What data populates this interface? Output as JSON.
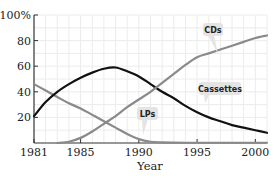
{
  "chart_data": {
    "type": "line",
    "title": "",
    "xlabel": "Year",
    "ylabel": "",
    "xlim": [
      1981,
      2001
    ],
    "ylim": [
      0,
      100
    ],
    "grid": true,
    "legend": "inline-callouts",
    "x_ticks": [
      1981,
      1985,
      1990,
      1995,
      2000
    ],
    "x_tick_labels": [
      "1981",
      "1985",
      "1990",
      "1995",
      "2000"
    ],
    "y_ticks": [
      20,
      40,
      60,
      80,
      100
    ],
    "y_tick_labels": [
      "20",
      "40",
      "60",
      "80",
      "100%"
    ],
    "x": [
      1981,
      1982,
      1983,
      1984,
      1985,
      1986,
      1987,
      1988,
      1989,
      1990,
      1991,
      1992,
      1993,
      1994,
      1995,
      1996,
      1997,
      1998,
      1999,
      2000,
      2001
    ],
    "series": [
      {
        "name": "LPs",
        "color": "#8a8a8a",
        "values": [
          46,
          41,
          36,
          31,
          27,
          22,
          17,
          12,
          7,
          3,
          1,
          0.5,
          0.3,
          0.2,
          0.2,
          0.2,
          0.2,
          0.2,
          0.2,
          0.2,
          0.2
        ]
      },
      {
        "name": "Cassettes",
        "color": "#111111",
        "values": [
          21,
          32,
          40,
          46,
          51,
          55,
          58,
          59,
          56,
          52,
          46,
          40,
          35,
          29,
          24,
          20,
          17,
          14,
          12,
          10,
          8
        ]
      },
      {
        "name": "CDs",
        "color": "#8a8a8a",
        "values": [
          null,
          null,
          0,
          1,
          4,
          9,
          15,
          21,
          28,
          34,
          40,
          47,
          54,
          61,
          67,
          70,
          73,
          76,
          79,
          82,
          84
        ]
      }
    ],
    "annotations": [
      {
        "text": "CDs",
        "series": "CDs"
      },
      {
        "text": "Cassettes",
        "series": "Cassettes"
      },
      {
        "text": "LPs",
        "series": "LPs"
      }
    ]
  }
}
